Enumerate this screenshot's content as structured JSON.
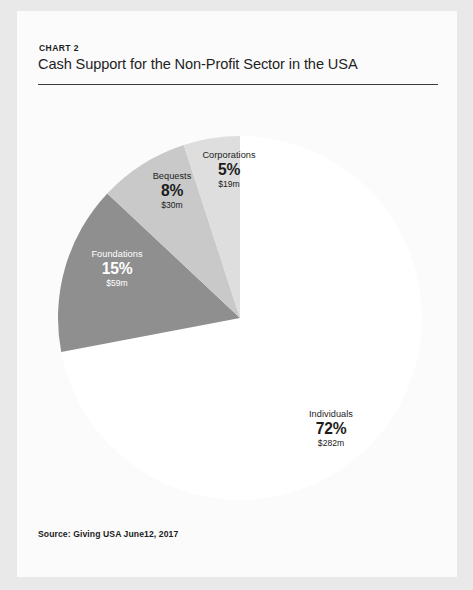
{
  "header": {
    "chart_label": "CHART 2",
    "title": "Cash Support for the Non-Profit Sector in the USA"
  },
  "footer": {
    "source": "Source: Giving USA June12, 2017"
  },
  "chart_data": {
    "type": "pie",
    "title": "Cash Support for the Non-Profit Sector in the USA",
    "categories": [
      "Individuals",
      "Foundations",
      "Bequests",
      "Corporations"
    ],
    "values": [
      72,
      15,
      8,
      5
    ],
    "value_unit": "percent",
    "amounts": [
      "$282m",
      "$30m",
      "$59m",
      "$19m"
    ],
    "legend": "none",
    "slices": [
      {
        "name": "Individuals",
        "percent": 72,
        "percent_label": "72%",
        "amount_label": "$282m",
        "amount_value": 282,
        "color": "#ffffff",
        "label_color": "#1c1c1c"
      },
      {
        "name": "Foundations",
        "percent": 15,
        "percent_label": "15%",
        "amount_label": "$59m",
        "amount_value": 59,
        "color": "#8f8f8f",
        "label_color": "#ffffff"
      },
      {
        "name": "Bequests",
        "percent": 8,
        "percent_label": "8%",
        "amount_label": "$30m",
        "amount_value": 30,
        "color": "#c9c9c9",
        "label_color": "#1c1c1c"
      },
      {
        "name": "Corporations",
        "percent": 5,
        "percent_label": "5%",
        "amount_label": "$19m",
        "amount_value": 19,
        "color": "#dedede",
        "label_color": "#1c1c1c"
      }
    ]
  },
  "colors": {
    "page": "#fbfbfb",
    "backdrop": "#e9e9e9",
    "rule": "#3a3a3a",
    "text": "#1c1c1c"
  }
}
